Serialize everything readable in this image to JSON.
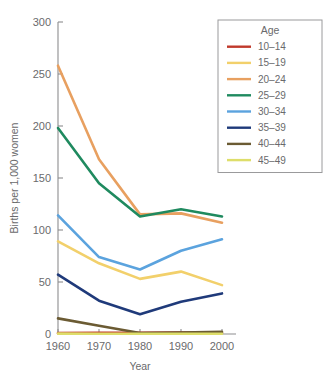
{
  "chart_data": {
    "type": "line",
    "title": "",
    "xlabel": "Year",
    "ylabel": "Births per 1,000 women",
    "x": [
      1960,
      1970,
      1980,
      1990,
      2000
    ],
    "xticklabels": [
      "1960",
      "1970",
      "1980",
      "1990",
      "2000"
    ],
    "yticklabels": [
      "0",
      "50",
      "100",
      "150",
      "200",
      "250",
      "300"
    ],
    "yticks": [
      0,
      50,
      100,
      150,
      200,
      250,
      300
    ],
    "ylim": [
      0,
      300
    ],
    "xlim": [
      1960,
      2000
    ],
    "grid": false,
    "legend_position": "top-right",
    "legend_title": "Age",
    "series": [
      {
        "name": "10–14",
        "color": "#c0392b",
        "values": [
          0.8,
          1.2,
          1.1,
          1.4,
          0.9
        ]
      },
      {
        "name": "15–19",
        "color": "#f2d06b",
        "values": [
          89,
          68,
          53,
          60,
          47
        ]
      },
      {
        "name": "20–24",
        "color": "#e8a060",
        "values": [
          258,
          168,
          115,
          116,
          107
        ]
      },
      {
        "name": "25–29",
        "color": "#1f8a5f",
        "values": [
          198,
          145,
          113,
          120,
          113
        ]
      },
      {
        "name": "30–34",
        "color": "#5ba3de",
        "values": [
          114,
          74,
          62,
          80,
          91
        ]
      },
      {
        "name": "35–39",
        "color": "#1f3a7a",
        "values": [
          57,
          32,
          19,
          31,
          39
        ]
      },
      {
        "name": "40–44",
        "color": "#6b5b33",
        "values": [
          15,
          8,
          1.0,
          1.5,
          2.0
        ]
      },
      {
        "name": "45–49",
        "color": "#dede6a",
        "values": [
          0.4,
          0.3,
          0.2,
          0.2,
          0.2
        ]
      }
    ]
  }
}
